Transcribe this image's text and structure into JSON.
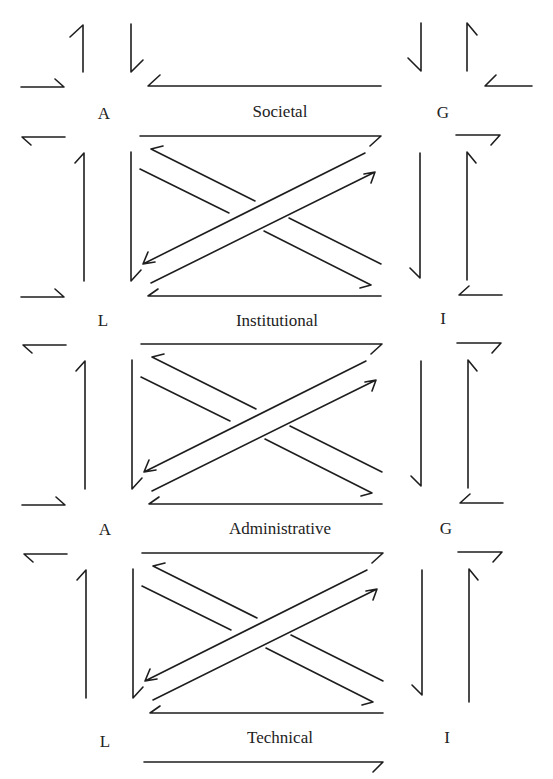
{
  "diagram": {
    "levels": [
      {
        "label": "Societal",
        "left_node": "A",
        "right_node": "G"
      },
      {
        "label": "Institutional",
        "left_node": "L",
        "right_node": "I"
      },
      {
        "label": "Administrative",
        "left_node": "A",
        "right_node": "G"
      },
      {
        "label": "Technical",
        "left_node": "L",
        "right_node": "I"
      }
    ],
    "colors": {
      "line": "#1e1e1e",
      "background": "#ffffff",
      "text": "#222222"
    }
  }
}
